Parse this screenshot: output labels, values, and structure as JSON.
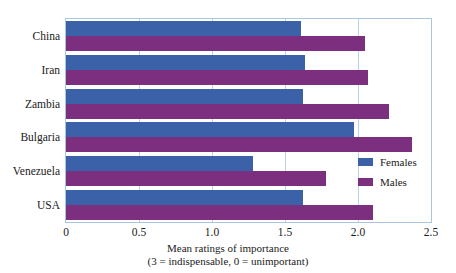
{
  "chart_data": {
    "type": "bar",
    "orientation": "horizontal",
    "title": "",
    "xlabel_line1": "Mean ratings of importance",
    "xlabel_line2": "(3 = indispensable, 0 = unimportant)",
    "ylabel": "",
    "categories": [
      "China",
      "Iran",
      "Zambia",
      "Bulgaria",
      "Venezuela",
      "USA"
    ],
    "series": [
      {
        "name": "Females",
        "color": "#3b62a8",
        "values": [
          1.61,
          1.64,
          1.62,
          1.97,
          1.28,
          1.62
        ]
      },
      {
        "name": "Males",
        "color": "#7b2f7e",
        "values": [
          2.05,
          2.07,
          2.21,
          2.37,
          1.78,
          2.1
        ]
      }
    ],
    "xlim": [
      0,
      2.5
    ],
    "xticks": [
      0,
      0.5,
      1.0,
      1.5,
      2.0,
      2.5
    ],
    "xtick_labels": [
      "0",
      "0.5",
      "1.0",
      "1.5",
      "2.0",
      "2.5"
    ],
    "grid": true,
    "grid_axis": "x",
    "legend_position": "center right (inside plot)",
    "frame_color": "#a8c6e0",
    "grid_color": "#b9d2e8",
    "background": "#ffffff"
  }
}
